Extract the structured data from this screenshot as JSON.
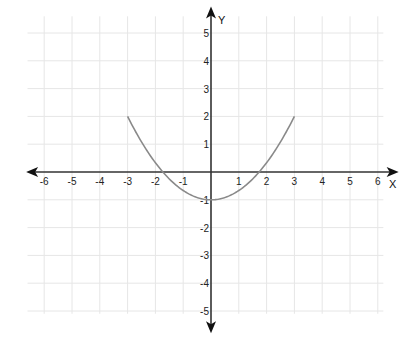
{
  "chart_data": {
    "type": "line",
    "title": "",
    "xlabel": "X",
    "ylabel": "Y",
    "xlim": [
      -6,
      6
    ],
    "ylim": [
      -5,
      5
    ],
    "grid": true,
    "x_ticks": [
      -6,
      -5,
      -4,
      -3,
      -2,
      -1,
      1,
      2,
      3,
      4,
      5,
      6
    ],
    "y_ticks": [
      5,
      4,
      3,
      2,
      1,
      -1,
      -2,
      -3,
      -4,
      -5
    ],
    "x_tick_labels": [
      "-6",
      "-5",
      "-4",
      "-3",
      "-2",
      "-1",
      "1",
      "2",
      "3",
      "4",
      "5",
      "6"
    ],
    "y_tick_labels": [
      "5",
      "4",
      "3",
      "2",
      "1",
      "-1",
      "-2",
      "-3",
      "-4",
      "-5"
    ],
    "series": [
      {
        "name": "parabola",
        "description": "upward-opening parabola, vertex (0,-1), endpoints (-3,2) and (3,2)",
        "x": [
          -3,
          -2.5,
          -2,
          -1.5,
          -1,
          -0.5,
          0,
          0.5,
          1,
          1.5,
          2,
          2.5,
          3
        ],
        "values": [
          2,
          1.08,
          0.33,
          -0.25,
          -0.67,
          -0.92,
          -1,
          -0.92,
          -0.67,
          -0.25,
          0.33,
          1.08,
          2
        ]
      }
    ],
    "colors": {
      "curve": "#8a8a8a",
      "axis": "#333333",
      "grid": "#e6e6e6"
    }
  }
}
